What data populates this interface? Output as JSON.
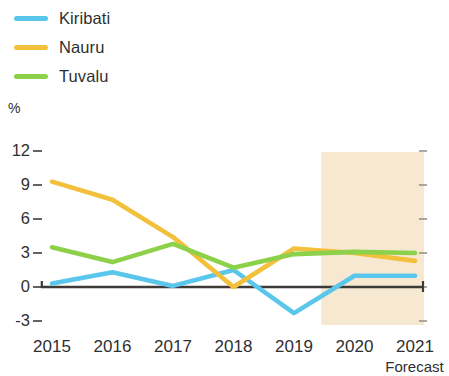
{
  "legend": {
    "position": "top-left",
    "items": [
      {
        "label": "Kiribati",
        "color": "#5BC6EC",
        "name": "legend-item-kiribati"
      },
      {
        "label": "Nauru",
        "color": "#F3C03C",
        "name": "legend-item-nauru"
      },
      {
        "label": "Tuvalu",
        "color": "#8DD04A",
        "name": "legend-item-tuvalu"
      }
    ]
  },
  "axes": {
    "y_unit": "%",
    "y_ticks": [
      "12",
      "9",
      "6",
      "3",
      "0",
      "-3"
    ],
    "x_ticks": [
      "2015",
      "2016",
      "2017",
      "2018",
      "2019",
      "2020",
      "2021"
    ]
  },
  "annotations": {
    "forecast_caption": "Forecast",
    "forecast_band_color": "#F7E8D2"
  },
  "chart_data": {
    "type": "line",
    "title": "",
    "subtitle": "",
    "xlabel": "",
    "ylabel": "%",
    "categories": [
      "2015",
      "2016",
      "2017",
      "2018",
      "2019",
      "2020",
      "2021"
    ],
    "ylim": [
      -3,
      12
    ],
    "ytick_values": [
      12,
      9,
      6,
      3,
      0,
      -3
    ],
    "grid": false,
    "legend_position": "top-left",
    "zero_line": true,
    "annotations": [
      {
        "type": "shaded-band",
        "label": "Forecast",
        "x_start": "2019.5",
        "x_end": "2021.2",
        "color": "#F7E8D2"
      }
    ],
    "series": [
      {
        "name": "Kiribati",
        "color": "#5BC6EC",
        "values": [
          0.3,
          1.3,
          0.1,
          1.5,
          -2.3,
          1.0,
          1.0
        ]
      },
      {
        "name": "Nauru",
        "color": "#F3C03C",
        "values": [
          9.3,
          7.7,
          4.4,
          0.0,
          3.4,
          3.0,
          2.3
        ]
      },
      {
        "name": "Tuvalu",
        "color": "#8DD04A",
        "values": [
          3.5,
          2.2,
          3.8,
          1.7,
          2.9,
          3.1,
          3.0
        ]
      }
    ]
  }
}
